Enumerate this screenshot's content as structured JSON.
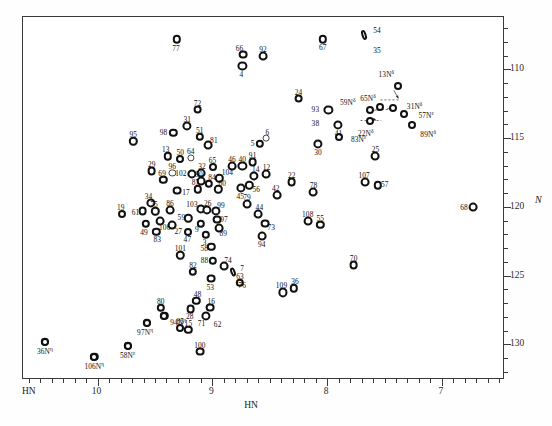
{
  "figure": {
    "x_axis": {
      "title": "HN",
      "corner_label": "HN",
      "ticks": [
        10,
        9,
        8,
        7
      ],
      "range": [
        10.65,
        6.45
      ]
    },
    "y_axis": {
      "title": "N",
      "ticks": [
        110,
        115,
        120,
        125,
        130
      ],
      "range": [
        106.2,
        132.6
      ]
    }
  },
  "chart_data": {
    "type": "scatter",
    "title": "",
    "xlabel": "HN",
    "ylabel": "N",
    "xlim": [
      10.65,
      6.45
    ],
    "ylim": [
      132.6,
      106.2
    ],
    "grid": false,
    "legend": null,
    "axis_note": "x axis (1H) decreasing left-to-right; y axis (15N) increasing top-to-bottom, labelled on right side",
    "points": [
      {
        "label": "77",
        "x": 9.3,
        "y": 107.9,
        "lx": -1,
        "ly": 9,
        "size": 4.2
      },
      {
        "label": "66",
        "x": 8.72,
        "y": 109.0,
        "lx": -4,
        "ly": -7,
        "size": 4.4
      },
      {
        "label": "92",
        "x": 8.55,
        "y": 109.1,
        "lx": 0,
        "ly": -7,
        "size": 4.4
      },
      {
        "label": "4",
        "x": 8.73,
        "y": 109.8,
        "lx": -1,
        "ly": 8,
        "size": 4.6
      },
      {
        "label": "67",
        "x": 8.03,
        "y": 107.9,
        "lx": 0,
        "ly": 8,
        "size": 4.2
      },
      {
        "label": "54",
        "x": 7.67,
        "y": 107.6,
        "lx": 13,
        "ly": -5,
        "size": 4.0,
        "shape": "el",
        "w": 5,
        "h": 10,
        "rot": -18
      },
      {
        "label": "35",
        "x": 7.67,
        "y": 108.3,
        "lx": 13,
        "ly": 5,
        "size": 0
      },
      {
        "label": "24",
        "x": 8.24,
        "y": 112.2,
        "lx": 0,
        "ly": -7,
        "size": 4.4
      },
      {
        "label": "93",
        "x": 7.98,
        "y": 113.0,
        "lx": -13,
        "ly": -1,
        "size": 4.6
      },
      {
        "label": "38",
        "x": 7.98,
        "y": 113.7,
        "lx": -13,
        "ly": 4,
        "size": 0
      },
      {
        "label": "41",
        "x": 7.9,
        "y": 114.1,
        "lx": 1,
        "ly": 8,
        "size": 4.6
      },
      {
        "label": "72",
        "x": 9.12,
        "y": 113.0,
        "lx": 0,
        "ly": -7,
        "size": 4.4
      },
      {
        "label": "31",
        "x": 9.21,
        "y": 114.2,
        "lx": 0,
        "ly": -7,
        "size": 4.6
      },
      {
        "label": "98",
        "x": 9.33,
        "y": 114.7,
        "lx": -10,
        "ly": -1,
        "size": 4.2
      },
      {
        "label": "51",
        "x": 9.1,
        "y": 115.0,
        "lx": 0,
        "ly": -7,
        "size": 4.2
      },
      {
        "label": "81",
        "x": 9.03,
        "y": 115.6,
        "lx": 6,
        "ly": -5,
        "size": 4.4
      },
      {
        "label": "95",
        "x": 9.68,
        "y": 115.3,
        "lx": 0,
        "ly": -7,
        "size": 4.2
      },
      {
        "label": "13",
        "x": 9.38,
        "y": 116.4,
        "lx": -2,
        "ly": -7,
        "size": 4.2
      },
      {
        "label": "50",
        "x": 9.27,
        "y": 116.6,
        "lx": 0,
        "ly": -7,
        "size": 4.0
      },
      {
        "label": "64",
        "x": 9.18,
        "y": 116.5,
        "lx": 0,
        "ly": -7,
        "size": 3.6
      },
      {
        "label": "29",
        "x": 9.52,
        "y": 117.5,
        "lx": 0,
        "ly": -7,
        "size": 4.4
      },
      {
        "label": "96",
        "x": 9.34,
        "y": 117.6,
        "lx": 0,
        "ly": -7,
        "size": 3.6
      },
      {
        "label": "102",
        "x": 9.17,
        "y": 117.7,
        "lx": -11,
        "ly": -1,
        "size": 4.6
      },
      {
        "label": "69",
        "x": 9.42,
        "y": 118.1,
        "lx": -1,
        "ly": -7,
        "size": 4.2
      },
      {
        "label": "32",
        "x": 9.09,
        "y": 117.6,
        "lx": 1,
        "ly": -7,
        "size": 4.4
      },
      {
        "label": "90",
        "x": 9.09,
        "y": 118.2,
        "lx": -2,
        "ly": -7,
        "size": 4.4
      },
      {
        "label": "84",
        "x": 9.02,
        "y": 118.4,
        "lx": 3,
        "ly": -7,
        "size": 4.2
      },
      {
        "label": "104",
        "x": 8.93,
        "y": 118.0,
        "lx": 8,
        "ly": -6,
        "size": 4.2
      },
      {
        "label": "65",
        "x": 8.99,
        "y": 117.2,
        "lx": 0,
        "ly": -7,
        "size": 4.0
      },
      {
        "label": "87",
        "x": 9.12,
        "y": 118.8,
        "lx": -2,
        "ly": -7,
        "size": 4.2
      },
      {
        "label": "60",
        "x": 8.94,
        "y": 118.8,
        "lx": 4,
        "ly": -6,
        "size": 4.2
      },
      {
        "label": "17",
        "x": 9.3,
        "y": 118.9,
        "lx": 9,
        "ly": 1,
        "size": 4.4
      },
      {
        "label": "46",
        "x": 8.82,
        "y": 117.1,
        "lx": 0,
        "ly": -7,
        "size": 4.4
      },
      {
        "label": "40",
        "x": 8.73,
        "y": 117.1,
        "lx": 0,
        "ly": -7,
        "size": 4.6
      },
      {
        "label": "91",
        "x": 8.64,
        "y": 116.8,
        "lx": 0,
        "ly": -7,
        "size": 4.4
      },
      {
        "label": "14",
        "x": 8.63,
        "y": 117.8,
        "lx": 2,
        "ly": -7,
        "size": 4.6
      },
      {
        "label": "12",
        "x": 8.52,
        "y": 117.7,
        "lx": 0,
        "ly": -7,
        "size": 4.4
      },
      {
        "label": "45",
        "x": 8.74,
        "y": 118.7,
        "lx": -1,
        "ly": 8,
        "size": 4.6
      },
      {
        "label": "56",
        "x": 8.67,
        "y": 118.5,
        "lx": 7,
        "ly": 4,
        "size": 4.2
      },
      {
        "label": "5",
        "x": 8.58,
        "y": 115.5,
        "lx": -7,
        "ly": -1,
        "size": 4.2
      },
      {
        "label": "6",
        "x": 8.52,
        "y": 115.1,
        "lx": 1,
        "ly": -6,
        "size": 3.4
      },
      {
        "label": "34",
        "x": 9.53,
        "y": 119.8,
        "lx": -2,
        "ly": -7,
        "size": 4.6
      },
      {
        "label": "61",
        "x": 9.6,
        "y": 120.4,
        "lx": -7,
        "ly": 1,
        "size": 4.4
      },
      {
        "label": "75",
        "x": 9.49,
        "y": 120.4,
        "lx": -1,
        "ly": -7,
        "size": 4.2
      },
      {
        "label": "86",
        "x": 9.36,
        "y": 120.3,
        "lx": 0,
        "ly": -7,
        "size": 4.4
      },
      {
        "label": "106",
        "x": 9.45,
        "y": 121.1,
        "lx": 5,
        "ly": 6,
        "size": 4.4
      },
      {
        "label": "49",
        "x": 9.57,
        "y": 121.3,
        "lx": -2,
        "ly": 8,
        "size": 4.2
      },
      {
        "label": "83",
        "x": 9.48,
        "y": 121.9,
        "lx": 1,
        "ly": 7,
        "size": 4.2
      },
      {
        "label": "27",
        "x": 9.34,
        "y": 121.4,
        "lx": 6,
        "ly": 6,
        "size": 4.4
      },
      {
        "label": "19",
        "x": 9.78,
        "y": 120.6,
        "lx": -1,
        "ly": -7,
        "size": 4.0
      },
      {
        "label": "103",
        "x": 9.09,
        "y": 120.2,
        "lx": -9,
        "ly": -5,
        "size": 4.6
      },
      {
        "label": "26",
        "x": 9.04,
        "y": 120.3,
        "lx": 1,
        "ly": -7,
        "size": 4.6
      },
      {
        "label": "99",
        "x": 8.96,
        "y": 120.4,
        "lx": 5,
        "ly": -6,
        "size": 4.6
      },
      {
        "label": "59",
        "x": 9.2,
        "y": 120.9,
        "lx": -7,
        "ly": -1,
        "size": 4.2
      },
      {
        "label": "9",
        "x": 9.09,
        "y": 121.3,
        "lx": -4,
        "ly": 5,
        "size": 4.2
      },
      {
        "label": "97",
        "x": 8.95,
        "y": 121.0,
        "lx": 7,
        "ly": -1,
        "size": 4.4
      },
      {
        "label": "89",
        "x": 8.93,
        "y": 121.6,
        "lx": 4,
        "ly": 5,
        "size": 4.4
      },
      {
        "label": "47",
        "x": 9.2,
        "y": 121.9,
        "lx": -1,
        "ly": 7,
        "size": 4.0
      },
      {
        "label": "3",
        "x": 9.05,
        "y": 122.1,
        "lx": -1,
        "ly": 7,
        "size": 4.2
      },
      {
        "label": "58",
        "x": 9.0,
        "y": 123.0,
        "lx": -7,
        "ly": 1,
        "size": 4.2
      },
      {
        "label": "88",
        "x": 8.99,
        "y": 124.0,
        "lx": -8,
        "ly": -1,
        "size": 4.2
      },
      {
        "label": "79",
        "x": 8.69,
        "y": 119.9,
        "lx": 0,
        "ly": -7,
        "size": 4.4
      },
      {
        "label": "44",
        "x": 8.59,
        "y": 120.6,
        "lx": 1,
        "ly": -7,
        "size": 4.4
      },
      {
        "label": "6b",
        "x": 8.61,
        "y": 121.5,
        "lx": -5,
        "ly": 4,
        "size": 0
      },
      {
        "label": "73",
        "x": 8.53,
        "y": 121.3,
        "lx": 6,
        "ly": 3,
        "size": 4.4
      },
      {
        "label": "94",
        "x": 8.56,
        "y": 122.2,
        "lx": 0,
        "ly": 8,
        "size": 4.4
      },
      {
        "label": "74",
        "x": 8.89,
        "y": 124.4,
        "lx": 4,
        "ly": -6,
        "size": 4.4
      },
      {
        "label": "7",
        "x": 8.81,
        "y": 124.8,
        "lx": 9,
        "ly": -4,
        "size": 4.2,
        "shape": "el",
        "w": 5,
        "h": 9,
        "rot": -20
      },
      {
        "label": "76",
        "x": 8.81,
        "y": 125.4,
        "lx": 9,
        "ly": 5,
        "size": 0
      },
      {
        "label": "53",
        "x": 9.0,
        "y": 125.3,
        "lx": -1,
        "ly": 8,
        "size": 4.4
      },
      {
        "label": "82",
        "x": 9.16,
        "y": 124.8,
        "lx": 0,
        "ly": -7,
        "size": 4.2
      },
      {
        "label": "101",
        "x": 9.27,
        "y": 123.6,
        "lx": 0,
        "ly": -7,
        "size": 4.2
      },
      {
        "label": "63",
        "x": 8.75,
        "y": 125.6,
        "lx": 0,
        "ly": -7,
        "size": 4.2
      },
      {
        "label": "109",
        "x": 8.38,
        "y": 126.3,
        "lx": -1,
        "ly": -7,
        "size": 4.6
      },
      {
        "label": "36",
        "x": 8.28,
        "y": 126.0,
        "lx": 1,
        "ly": -7,
        "size": 4.2
      },
      {
        "label": "70",
        "x": 7.76,
        "y": 124.3,
        "lx": 0,
        "ly": -7,
        "size": 4.4
      },
      {
        "label": "108",
        "x": 8.16,
        "y": 121.1,
        "lx": 0,
        "ly": -7,
        "size": 4.4
      },
      {
        "label": "55",
        "x": 8.05,
        "y": 121.4,
        "lx": 0,
        "ly": -7,
        "size": 4.2
      },
      {
        "label": "42",
        "x": 8.43,
        "y": 119.2,
        "lx": -1,
        "ly": -7,
        "size": 4.4
      },
      {
        "label": "22",
        "x": 8.3,
        "y": 118.3,
        "lx": 0,
        "ly": -7,
        "size": 4.4
      },
      {
        "label": "78",
        "x": 8.11,
        "y": 119.0,
        "lx": 0,
        "ly": -7,
        "size": 4.4
      },
      {
        "label": "30",
        "x": 8.07,
        "y": 115.5,
        "lx": 0,
        "ly": 8,
        "size": 4.6
      },
      {
        "label": "107",
        "x": 7.66,
        "y": 118.3,
        "lx": -1,
        "ly": -7,
        "size": 4.4
      },
      {
        "label": "57",
        "x": 7.55,
        "y": 118.5,
        "lx": 7,
        "ly": -1,
        "size": 4.2
      },
      {
        "label": "25",
        "x": 7.57,
        "y": 116.4,
        "lx": 0,
        "ly": -7,
        "size": 4.4
      },
      {
        "label": "68",
        "x": 6.72,
        "y": 120.1,
        "lx": -9,
        "ly": 0,
        "size": 4.4
      },
      {
        "label": "80",
        "x": 9.44,
        "y": 127.4,
        "lx": 0,
        "ly": -7,
        "size": 4.2
      },
      {
        "label": "94b",
        "x": 9.41,
        "y": 128.0,
        "lx": 0,
        "ly": 0,
        "size": 4.2
      },
      {
        "label": "97b",
        "x": 9.56,
        "y": 128.5,
        "lx": 0,
        "ly": 0,
        "size": 4.2
      },
      {
        "label": "85",
        "x": 9.27,
        "y": 128.9,
        "lx": 0,
        "ly": -7,
        "size": 4.0
      },
      {
        "label": "15",
        "x": 9.2,
        "y": 129.0,
        "lx": 0,
        "ly": -7,
        "size": 4.2
      },
      {
        "label": "48",
        "x": 9.13,
        "y": 126.9,
        "lx": 1,
        "ly": -7,
        "size": 4.2
      },
      {
        "label": "28",
        "x": 9.18,
        "y": 127.5,
        "lx": -1,
        "ly": 7,
        "size": 4.4
      },
      {
        "label": "16",
        "x": 9.01,
        "y": 127.4,
        "lx": 1,
        "ly": -7,
        "size": 4.4
      },
      {
        "label": "71",
        "x": 9.05,
        "y": 128.0,
        "lx": -4,
        "ly": 7,
        "size": 4.6
      },
      {
        "label": "62",
        "x": 8.98,
        "y": 128.1,
        "lx": 4,
        "ly": 7,
        "size": 0
      },
      {
        "label": "100",
        "x": 9.1,
        "y": 130.6,
        "lx": 0,
        "ly": -7,
        "size": 4.4
      },
      {
        "label": "36b",
        "x": 10.45,
        "y": 129.9,
        "lx": 0,
        "ly": 0,
        "size": 4.2
      },
      {
        "label": "106b",
        "x": 10.02,
        "y": 131.0,
        "lx": 0,
        "ly": 0,
        "size": 4.2
      },
      {
        "label": "58b",
        "x": 9.73,
        "y": 130.2,
        "lx": 0,
        "ly": 0,
        "size": 4.2
      }
    ],
    "sidechain_points": [
      {
        "label": "13N",
        "sup": "δ",
        "x": 7.37,
        "y": 111.3,
        "lx": -12,
        "ly": -12
      },
      {
        "label": "59N",
        "sup": "δ",
        "x": 7.62,
        "y": 113.0,
        "lx": -22,
        "ly": -8
      },
      {
        "label": "65N",
        "sup": "δ",
        "x": 7.53,
        "y": 112.8,
        "lx": -12,
        "ly": -9
      },
      {
        "label": "31N",
        "sup": "δ",
        "x": 7.42,
        "y": 112.9,
        "lx": 22,
        "ly": -2
      },
      {
        "label": "57N",
        "sup": "ε",
        "x": 7.32,
        "y": 113.3,
        "lx": 22,
        "ly": 1
      },
      {
        "label": "22N",
        "sup": "δ",
        "x": 7.62,
        "y": 113.8,
        "lx": -4,
        "ly": 12
      },
      {
        "label": "89N",
        "sup": "δ",
        "x": 7.25,
        "y": 114.1,
        "lx": 16,
        "ly": 9
      },
      {
        "label": "83N",
        "sup": "ε",
        "x": 7.89,
        "y": 115.0,
        "lx": 20,
        "ly": 2
      },
      {
        "label": "36N",
        "sup": "η",
        "x": 10.45,
        "y": 129.9,
        "lx": 0,
        "ly": 9
      },
      {
        "label": "106N",
        "sup": "η",
        "x": 10.02,
        "y": 131.0,
        "lx": 0,
        "ly": 9
      },
      {
        "label": "58N",
        "sup": "ε",
        "x": 9.73,
        "y": 130.2,
        "lx": 0,
        "ly": 9
      },
      {
        "label": "97N",
        "sup": "η",
        "x": 9.56,
        "y": 128.5,
        "lx": -2,
        "ly": 9
      },
      {
        "label": "94N",
        "sup": "η",
        "x": 9.41,
        "y": 128.0,
        "lx": 14,
        "ly": 6
      }
    ],
    "nh2_pairs": [
      {
        "name": "pair-13",
        "x1": 7.37,
        "y1": 112.3,
        "x2": 7.53,
        "y2": 112.3
      },
      {
        "name": "pair-59",
        "x1": 7.55,
        "y1": 113.0,
        "x2": 7.42,
        "y2": 113.0
      },
      {
        "name": "pair-22",
        "x1": 7.7,
        "y1": 113.8,
        "x2": 7.52,
        "y2": 113.8
      }
    ]
  }
}
